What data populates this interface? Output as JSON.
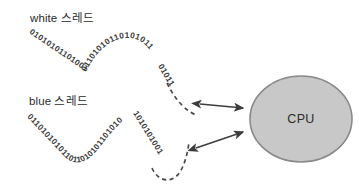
{
  "figure": {
    "background_color": "#ffffff",
    "width": 359,
    "height": 196
  },
  "labels": {
    "thread_white": "white 스레드",
    "thread_blue": "blue 스레드"
  },
  "cpu": {
    "label": "CPU",
    "fill_color": "#c8c8c8",
    "stroke_color": "#8a8a8a"
  },
  "threads": [
    {
      "id": "white-thread",
      "name": "white 스레드",
      "bits_upper_left": "01010101101001",
      "bits_peak": "01101010110101011",
      "bits_descend": "01011",
      "tail_style": "dashed",
      "tail_color": "#4a4a4a"
    },
    {
      "id": "blue-thread",
      "name": "blue 스레드",
      "bits_upper_left": "0110101010101",
      "bits_valley": "1011010101101010",
      "bits_descend": "1010101001",
      "tail_style": "dashed",
      "tail_color": "#4a4a4a"
    }
  ],
  "connectors": [
    {
      "id": "arrow-white-cpu",
      "direction": "bidirectional",
      "from": "white-thread",
      "to": "cpu",
      "color": "#3c3c3c"
    },
    {
      "id": "arrow-blue-cpu",
      "direction": "bidirectional",
      "from": "blue-thread",
      "to": "cpu",
      "color": "#3c3c3c"
    }
  ]
}
